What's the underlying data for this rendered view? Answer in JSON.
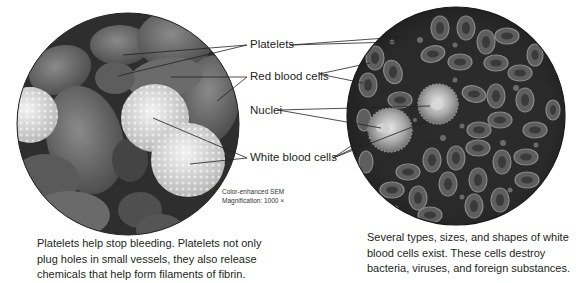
{
  "figure": {
    "left_panel": {
      "name": "SEM micrograph of blood cells",
      "sem_caption": {
        "line1": "Color-enhanced  SEM",
        "line2": "Magnification: 1000 ×"
      },
      "caption": {
        "line1": "Platelets help stop bleeding. Platelets not only",
        "line2": "plug holes in small vessels, they also release",
        "line3": "chemicals that help form filaments of fibrin."
      }
    },
    "right_panel": {
      "name": "Illustration of blood cells",
      "caption": {
        "line1": "Several types, sizes, and shapes of white",
        "line2": "blood cells exist. These cells destroy",
        "line3": "bacteria, viruses, and foreign substances."
      }
    },
    "labels": [
      {
        "id": "platelets",
        "text": "Platelets"
      },
      {
        "id": "red-blood-cells",
        "text": "Red blood cells"
      },
      {
        "id": "nuclei",
        "text": "Nuclei"
      },
      {
        "id": "white-blood-cells",
        "text": "White blood cells"
      }
    ],
    "colors": {
      "background": "#ffffff",
      "text": "#231f20",
      "leader_line": "#231f20",
      "sem_background": "#3a3a3a",
      "illustration_background": "#2b2b2b"
    }
  }
}
